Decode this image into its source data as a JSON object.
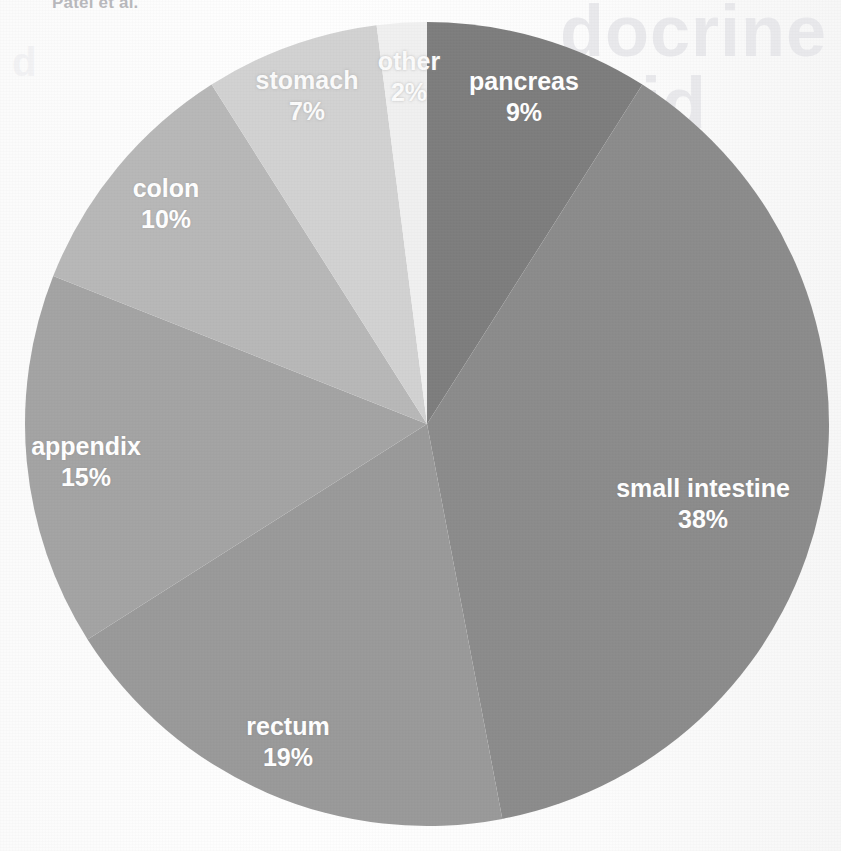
{
  "page": {
    "running_head": "Patel et al.",
    "background_color": "#fdfdfd"
  },
  "bleed_through": {
    "line_1": "docrine",
    "line_2": "oid",
    "line_3": "ch",
    "line_4": "d",
    "line_5": "for",
    "line_6": "ther",
    "line_7": "Mar"
  },
  "chart_data": {
    "type": "pie",
    "title": "",
    "subtitle": "",
    "xlabel": "",
    "ylabel": "",
    "legend_position": "none",
    "grid": false,
    "labels_inside_slices": true,
    "value_unit": "%",
    "total": 100,
    "start_angle_deg": 0,
    "direction": "clockwise",
    "categories": [
      "pancreas",
      "small intestine",
      "rectum",
      "appendix",
      "colon",
      "stomach",
      "other"
    ],
    "values": [
      9,
      38,
      19,
      15,
      10,
      7,
      2
    ],
    "colors": [
      "#7e7e7e",
      "#8c8c8c",
      "#9a9a9a",
      "#a4a4a4",
      "#b8b8b8",
      "#d2d2d2",
      "#f0f0f0"
    ],
    "slices": [
      {
        "name": "pancreas",
        "label": "pancreas",
        "value": 9,
        "value_label": "9%",
        "color": "#7e7e7e",
        "label_x": 524,
        "label_y": 96
      },
      {
        "name": "small intestine",
        "label": "small intestine",
        "value": 38,
        "value_label": "38%",
        "color": "#8c8c8c",
        "label_x": 703,
        "label_y": 503
      },
      {
        "name": "rectum",
        "label": "rectum",
        "value": 19,
        "value_label": "19%",
        "color": "#9a9a9a",
        "label_x": 288,
        "label_y": 741
      },
      {
        "name": "appendix",
        "label": "appendix",
        "value": 15,
        "value_label": "15%",
        "color": "#a4a4a4",
        "label_x": 86,
        "label_y": 461
      },
      {
        "name": "colon",
        "label": "colon",
        "value": 10,
        "value_label": "10%",
        "color": "#b8b8b8",
        "label_x": 166,
        "label_y": 203
      },
      {
        "name": "stomach",
        "label": "stomach",
        "value": 7,
        "value_label": "7%",
        "color": "#d2d2d2",
        "label_x": 307,
        "label_y": 95
      },
      {
        "name": "other",
        "label": "other",
        "value": 2,
        "value_label": "2%",
        "color": "#f0f0f0",
        "label_x": 409,
        "label_y": 76
      }
    ],
    "geometry": {
      "center_x": 427,
      "center_y": 424,
      "radius": 402
    }
  }
}
